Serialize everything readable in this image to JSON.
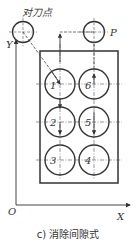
{
  "figure": {
    "caption": "c) 消除间隙式",
    "tool_setting_point_label": "对刀点",
    "point_p_label": "P",
    "axes": {
      "x_label": "X",
      "y_label": "Y",
      "origin_label": "O"
    },
    "holes": [
      {
        "label": "1",
        "col": 0,
        "row": 0
      },
      {
        "label": "2",
        "col": 0,
        "row": 1
      },
      {
        "label": "3",
        "col": 0,
        "row": 2
      },
      {
        "label": "4",
        "col": 1,
        "row": 2
      },
      {
        "label": "5",
        "col": 1,
        "row": 1
      },
      {
        "label": "6",
        "col": 1,
        "row": 0
      }
    ],
    "colors": {
      "line": "#333333",
      "background": "#ffffff"
    }
  }
}
